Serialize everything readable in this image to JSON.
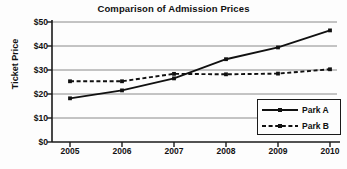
{
  "chart_data": {
    "type": "line",
    "title": "Comparison of Admission Prices",
    "xlabel": "",
    "ylabel": "Ticket Price",
    "categories": [
      "2005",
      "2006",
      "2007",
      "2008",
      "2009",
      "2010"
    ],
    "x": [
      2005,
      2006,
      2007,
      2008,
      2009,
      2010
    ],
    "ylim": [
      0,
      50
    ],
    "yticks": [
      0,
      10,
      20,
      30,
      40,
      50
    ],
    "ytick_labels": [
      "$0",
      "$10",
      "$20",
      "$30",
      "$40",
      "$50"
    ],
    "xtick_labels": [
      "2005",
      "2006",
      "2007",
      "2008",
      "2009",
      "2010"
    ],
    "grid": true,
    "grid_axis": "y",
    "legend_position": "lower right",
    "series": [
      {
        "name": "Park A",
        "values": [
          18.2,
          21.5,
          26.5,
          34.5,
          39.4,
          46.5
        ],
        "line_style": "solid",
        "color": "#111111",
        "marker": "dot"
      },
      {
        "name": "Park B",
        "values": [
          25.3,
          25.3,
          28.4,
          28.2,
          28.5,
          30.3
        ],
        "line_style": "dashed",
        "color": "#111111",
        "marker": "dot"
      }
    ]
  },
  "legend": {
    "items": [
      {
        "label": "Park A"
      },
      {
        "label": "Park B"
      }
    ]
  },
  "colors": {
    "axis": "#1a1a1a",
    "grid": "#8a8a8a",
    "series": "#111111",
    "background": "#fdfdfd"
  }
}
